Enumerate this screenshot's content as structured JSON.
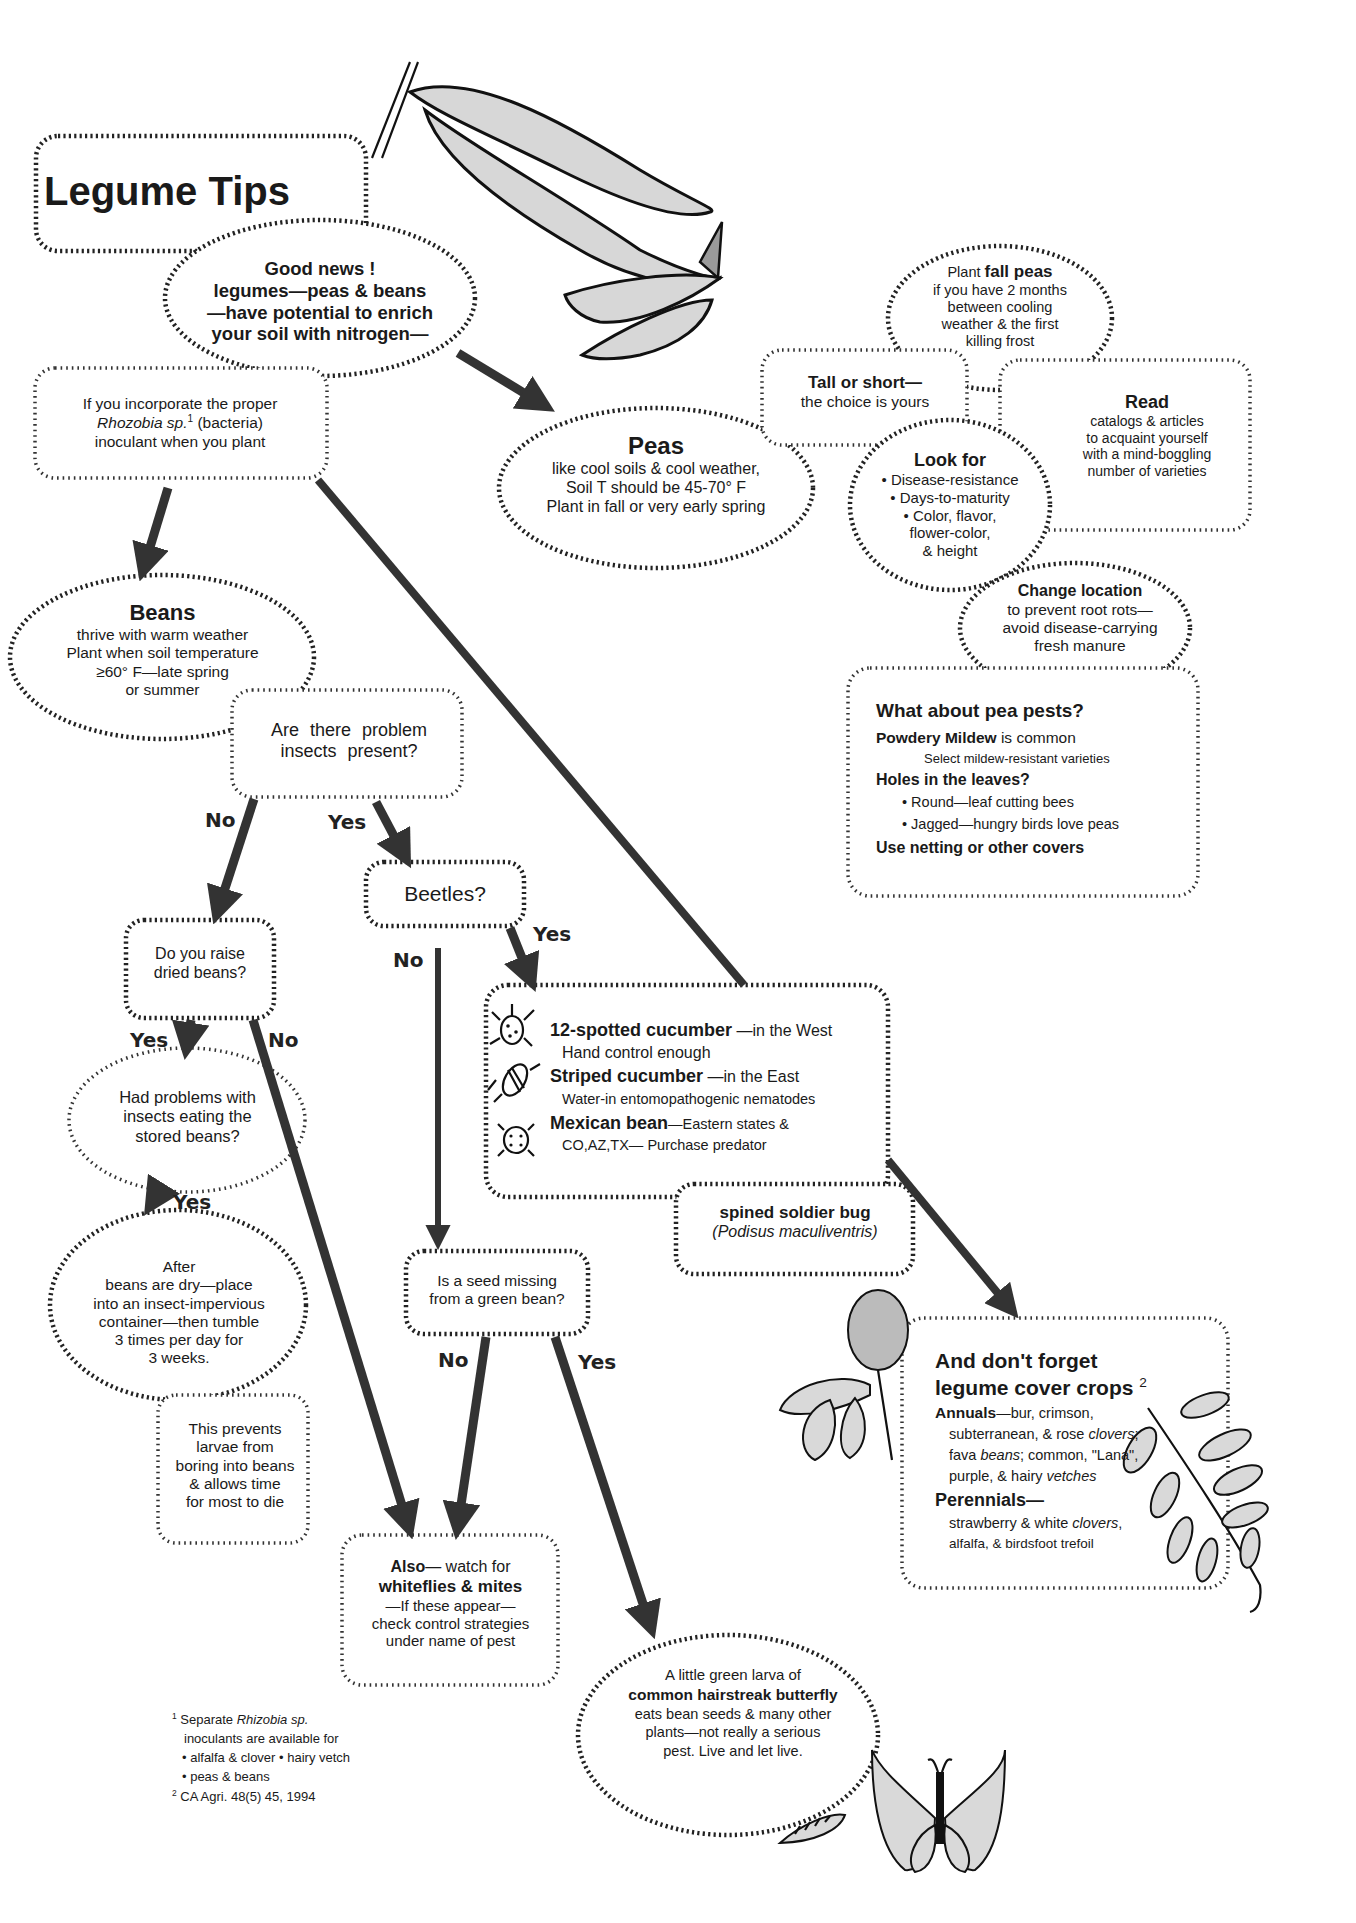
{
  "title": "Legume Tips",
  "nodes": {
    "good_news": {
      "lines": [
        "Good news !",
        "legumes—peas & beans",
        "—have potential to enrich",
        "your soil with nitrogen—"
      ]
    },
    "inoculant": {
      "line1": "If you incorporate the proper",
      "line2_italic": "Rhozobia sp.",
      "line2_sup": "1",
      "line2_rest": " (bacteria)",
      "line3": "inoculant when you plant"
    },
    "peas": {
      "title": "Peas",
      "lines": [
        "like cool soils & cool weather,",
        "Soil T should be 45-70° F",
        "Plant in fall or very early spring"
      ]
    },
    "fall_peas": {
      "prefix": "Plant ",
      "bold": "fall peas",
      "lines": [
        "if you have 2 months",
        "between cooling",
        "weather & the first",
        "killing frost"
      ]
    },
    "tall_short": {
      "title": "Tall or short—",
      "line": "the choice is yours"
    },
    "read": {
      "title": "Read",
      "lines": [
        "catalogs & articles",
        "to acquaint yourself",
        "with a mind-boggling",
        "number of varieties"
      ]
    },
    "look_for": {
      "title": "Look for",
      "lines": [
        "• Disease-resistance",
        "• Days-to-maturity",
        "• Color, flavor,",
        "flower-color,",
        "& height"
      ]
    },
    "change_location": {
      "title": "Change location",
      "lines": [
        "to prevent root rots—",
        "avoid disease-carrying",
        "fresh manure"
      ]
    },
    "pea_pests": {
      "title": "What about pea pests?",
      "mildew_bold": "Powdery Mildew",
      "mildew_rest": " is common",
      "mildew_tip": "Select mildew-resistant varieties",
      "holes": "Holes in the leaves?",
      "bullets": [
        "Round—leaf cutting bees",
        "Jagged—hungry birds love peas"
      ],
      "netting": "Use netting or other covers"
    },
    "beans": {
      "title": "Beans",
      "lines": [
        "thrive with warm weather",
        "Plant when soil temperature",
        "≥60° F—late spring",
        "or summer"
      ]
    },
    "problem_insects": {
      "lines": [
        "Are there problem",
        "insects present?"
      ]
    },
    "beetles": {
      "label": "Beetles?"
    },
    "beetle_types": {
      "items": [
        {
          "name": "12-spotted cucumber",
          "region": " —in the West",
          "control": "Hand control enough",
          "icon": "spotted-cucumber-beetle-icon"
        },
        {
          "name": "Striped  cucumber",
          "region": " —in the East",
          "control": "Water-in entomopathogenic nematodes",
          "icon": "striped-cucumber-beetle-icon"
        },
        {
          "name": "Mexican bean",
          "region": "—Eastern states &",
          "control": "CO,AZ,TX— Purchase predator",
          "icon": "mexican-bean-beetle-icon"
        }
      ]
    },
    "soldier_bug": {
      "name": "spined soldier bug",
      "latin": "(Podisus maculiventris)"
    },
    "dried_beans": {
      "lines": [
        "Do you raise",
        "dried beans?"
      ]
    },
    "stored_beans": {
      "lines": [
        "Had problems with",
        "insects eating the",
        "stored beans?"
      ]
    },
    "after_dry": {
      "lines": [
        "After",
        "beans are dry—place",
        "into an insect-impervious",
        "container—then tumble",
        "3 times per day for",
        "3 weeks."
      ]
    },
    "prevents": {
      "lines": [
        "This prevents",
        "larvae from",
        "boring into beans",
        "& allows time",
        "for most to die"
      ]
    },
    "seed_missing": {
      "lines": [
        "Is a seed missing",
        "from a green bean?"
      ]
    },
    "whiteflies": {
      "also_bold": "Also",
      "also_rest": "— watch for",
      "pests_bold": "whiteflies & mites",
      "lines": [
        "—If these appear—",
        "check control strategies",
        "under name of pest"
      ]
    },
    "hairstreak": {
      "line1": "A little green larva of",
      "bold": "common  hairstreak butterfly",
      "lines": [
        "eats bean seeds & many other",
        "plants—not really a serious",
        "pest.  Live and let live."
      ]
    },
    "cover_crops": {
      "title1": "And don't forget",
      "title2": "legume cover crops",
      "title_sup": "2",
      "annuals_bold": "Annuals",
      "annuals_l1": "—bur, crimson,",
      "annuals_l2a": "subterranean, & rose ",
      "annuals_l2i": "clovers",
      "annuals_l2b": ";",
      "annuals_l3a": "fava ",
      "annuals_l3i": "beans",
      "annuals_l3b": "; common, \"Lana\",",
      "annuals_l4a": "purple, & hairy ",
      "annuals_l4i": "vetches",
      "perennials_bold": "Perennials—",
      "per_l1a": "strawberry & white ",
      "per_l1i": "clovers",
      "per_l1b": ",",
      "per_l2": "alfalfa, & birdsfoot trefoil"
    }
  },
  "edge_labels": {
    "insects_no": "No",
    "insects_yes": "Yes",
    "beetles_no": "No",
    "beetles_yes": "Yes",
    "dried_yes": "Yes",
    "dried_no": "No",
    "stored_yes": "Yes",
    "seed_no": "No",
    "seed_yes": "Yes"
  },
  "footnotes": {
    "fn1_num": "1",
    "fn1_a": "Separate ",
    "fn1_i": "Rhizobia sp.",
    "fn1_l2": "inoculants are available for",
    "fn1_l3": "• alfalfa & clover  • hairy vetch",
    "fn1_l4": "• peas & beans",
    "fn2_num": "2",
    "fn2_text": "CA Agri. 48(5) 45, 1994"
  },
  "illustrations": [
    "pea-pods-icon",
    "clover-flower-icon",
    "vetch-sprig-icon",
    "butterfly-icon",
    "caterpillar-icon"
  ]
}
